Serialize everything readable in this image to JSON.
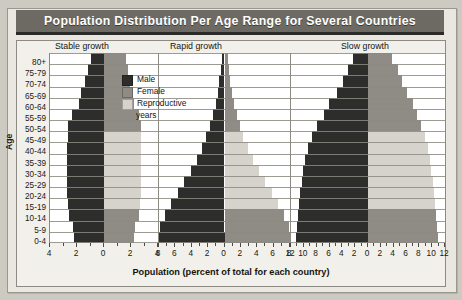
{
  "title": "Population Distribution Per Age Range for Several Countries",
  "axes": {
    "y_title": "Age",
    "x_title": "Population (percent of total for each country)"
  },
  "legend": {
    "items": [
      {
        "key": "male",
        "label": "Male",
        "color": "#2d2d2b"
      },
      {
        "key": "female",
        "label": "Female",
        "color": "#8e8c85"
      },
      {
        "key": "repro",
        "label": "Reproductive",
        "label2": "years",
        "color": "#d5d3cb"
      }
    ]
  },
  "chart_data": {
    "type": "bar",
    "subtype": "population-pyramid",
    "title": "Population Distribution Per Age Range for Several Countries",
    "xlabel": "Population (percent of total for each country)",
    "ylabel": "Age",
    "grid": true,
    "legend_position": "inside-top-left",
    "categories": [
      "80+",
      "75-79",
      "70-74",
      "65-69",
      "60-64",
      "55-59",
      "50-54",
      "45-49",
      "40-44",
      "35-39",
      "30-34",
      "25-29",
      "20-24",
      "15-19",
      "10-14",
      "5-9",
      "0-4"
    ],
    "reproductive_years_range": [
      "15-19",
      "20-24",
      "25-29",
      "30-34",
      "35-39",
      "40-44",
      "45-49"
    ],
    "series_note": "Each panel plots male percent to the left of its center axis and female percent to the right.",
    "panels": [
      {
        "name": "Stable growth",
        "xmax": 5,
        "xticks": [
          4,
          2,
          0,
          2,
          4
        ],
        "male": [
          1.2,
          1.5,
          1.8,
          2.1,
          2.3,
          3.0,
          3.3,
          3.3,
          3.4,
          3.4,
          3.4,
          3.4,
          3.4,
          3.3,
          3.2,
          2.9,
          2.8
        ],
        "female": [
          2.0,
          2.2,
          2.4,
          2.6,
          2.8,
          3.2,
          3.4,
          3.4,
          3.4,
          3.4,
          3.4,
          3.4,
          3.4,
          3.3,
          3.2,
          2.9,
          2.8
        ]
      },
      {
        "name": "Rapid growth",
        "xmax": 9,
        "xticks": [
          8,
          6,
          4,
          2,
          0,
          2,
          4,
          6,
          8
        ],
        "male": [
          0.4,
          0.5,
          0.7,
          0.9,
          1.2,
          1.6,
          2.0,
          2.5,
          3.1,
          3.8,
          4.6,
          5.5,
          6.4,
          7.3,
          8.2,
          8.8,
          9.0
        ],
        "female": [
          0.5,
          0.6,
          0.8,
          1.0,
          1.3,
          1.7,
          2.1,
          2.6,
          3.2,
          3.9,
          4.7,
          5.6,
          6.5,
          7.4,
          8.2,
          8.8,
          9.0
        ]
      },
      {
        "name": "Slow growth",
        "xmax": 13,
        "xticks": [
          12,
          10,
          8,
          6,
          4,
          2,
          0,
          2,
          4,
          6,
          8,
          10,
          12
        ],
        "male": [
          2.6,
          3.4,
          4.3,
          5.2,
          6.6,
          7.4,
          8.6,
          9.4,
          10.2,
          10.6,
          11.0,
          11.2,
          11.4,
          11.6,
          11.8,
          12.0,
          12.2
        ],
        "female": [
          4.0,
          5.0,
          5.8,
          6.6,
          7.6,
          8.2,
          9.0,
          9.6,
          10.1,
          10.4,
          10.7,
          10.9,
          11.1,
          11.3,
          11.5,
          11.7,
          11.9
        ]
      }
    ]
  }
}
